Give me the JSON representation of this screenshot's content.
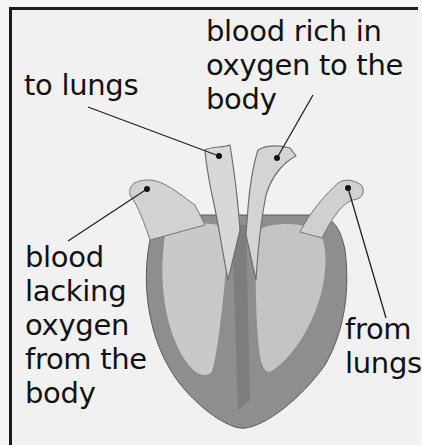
{
  "diagram": {
    "labels": {
      "to_lungs": "to lungs",
      "oxygen_rich": "blood rich in\noxygen to the\nbody",
      "oxygen_poor": "blood\nlacking\noxygen\nfrom the\nbody",
      "from_lungs": "from\nlungs"
    },
    "colors": {
      "outer_wall": "#8c8c8c",
      "inner_wall": "#a9a9a9",
      "chambers": "#c8c8c8",
      "vessels": "#d6d6d6",
      "background": "#f1f1f1",
      "text": "#111111"
    }
  }
}
